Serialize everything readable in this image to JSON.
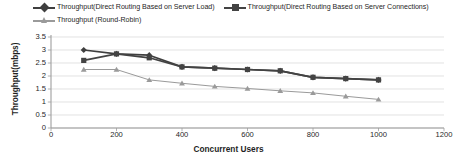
{
  "chart_data": {
    "type": "line",
    "title": "",
    "xlabel": "Concurrent Users",
    "ylabel": "Throughput(mbps)",
    "x": [
      100,
      200,
      300,
      400,
      500,
      600,
      700,
      800,
      900,
      1000
    ],
    "xlim": [
      0,
      1200
    ],
    "ylim": [
      0,
      3.5
    ],
    "xticks": [
      "0",
      "200",
      "400",
      "600",
      "800",
      "1000",
      "1200"
    ],
    "xtick_values": [
      0,
      200,
      400,
      600,
      800,
      1000,
      1200
    ],
    "yticks": [
      "0",
      "0.5",
      "1",
      "1.5",
      "2",
      "2.5",
      "3",
      "3.5"
    ],
    "ytick_values": [
      0,
      0.5,
      1,
      1.5,
      2,
      2.5,
      3,
      3.5
    ],
    "grid": "horizontal",
    "legend_position": "top",
    "series": [
      {
        "name": "Throughput(Direct Routing Based on Server Load)",
        "marker": "diamond",
        "color": "#3f3f3f",
        "values": [
          3.0,
          2.85,
          2.8,
          2.35,
          2.3,
          2.25,
          2.2,
          1.95,
          1.9,
          1.85
        ]
      },
      {
        "name": "Throughput(Direct Routing Based on Server Connections)",
        "marker": "square",
        "color": "#434343",
        "values": [
          2.6,
          2.85,
          2.7,
          2.35,
          2.3,
          2.25,
          2.2,
          1.95,
          1.9,
          1.85
        ]
      },
      {
        "name": "Throughput (Round-Robin)",
        "marker": "triangle",
        "color": "#9a9a9a",
        "values": [
          2.25,
          2.25,
          1.85,
          1.72,
          1.6,
          1.52,
          1.43,
          1.35,
          1.22,
          1.1
        ]
      }
    ]
  },
  "legend": {
    "items": [
      {
        "label": "Throughput(Direct Routing Based on Server Load)",
        "marker": "diamond",
        "color": "#3f3f3f"
      },
      {
        "label": "Throughput(Direct Routing Based on Server Connections)",
        "marker": "square",
        "color": "#434343"
      },
      {
        "label": "Throughput (Round-Robin)",
        "marker": "triangle",
        "color": "#9a9a9a"
      }
    ]
  },
  "axes": {
    "x_title": "Concurrent Users",
    "y_title": "Throughput(mbps)"
  }
}
